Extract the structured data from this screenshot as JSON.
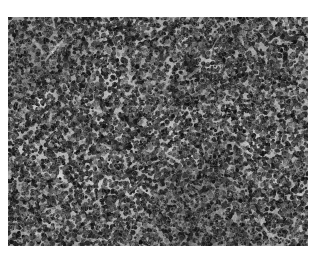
{
  "page": {
    "background_color": "#ffffff",
    "width": 317,
    "height": 258,
    "caption": ""
  },
  "micrograph": {
    "name": "histopathology-micrograph",
    "modality": "light-microscopy",
    "stain": "hematoxylin-and-eosin",
    "rendering": "grayscale",
    "description": "Dense sheet of small round lymphoid cells with scattered pale macrophages producing a starry-sky pattern",
    "frame": {
      "x": 8,
      "y": 17,
      "width": 300,
      "height": 229
    },
    "border_color": "#b7b7b7",
    "tone": {
      "background_gray": "#9b9b9b",
      "stroma_light_gray": "#c9c9c9",
      "nucleus_dark_gray": "#2d2d2d",
      "nucleus_mid_gray": "#545454",
      "highlight_gray": "#e8e8e8",
      "darkest_gray": "#141414",
      "lightest_gray": "#f2f2f2"
    },
    "texture": {
      "nuclei_count": 11000,
      "nucleus_radius_min": 1.1,
      "nucleus_radius_max": 2.6,
      "starry_sky_cells": 130,
      "starry_cell_radius_min": 2.5,
      "starry_cell_radius_max": 6.5,
      "pale_patch_count": 55,
      "pale_patch_radius_min": 5,
      "pale_patch_radius_max": 17,
      "grain_amount": 26,
      "blur_radius_px": 0.35,
      "seed": 20240517
    }
  }
}
